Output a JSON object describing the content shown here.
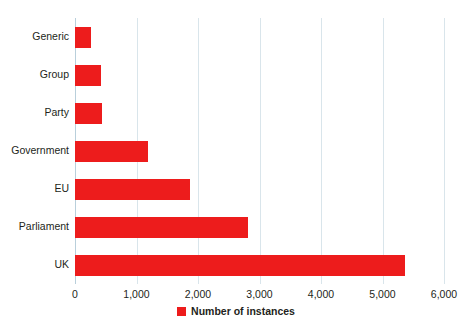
{
  "chart_data": {
    "type": "bar",
    "orientation": "horizontal",
    "title": "",
    "subtitle": "",
    "xlabel": "",
    "ylabel": "",
    "categories": [
      "Generic",
      "Group",
      "Party",
      "Government",
      "EU",
      "Parliament",
      "UK"
    ],
    "values": [
      260,
      420,
      440,
      1190,
      1870,
      2810,
      5370
    ],
    "series": [
      {
        "name": "Number of instances",
        "color": "#ed1c1c",
        "values": [
          260,
          420,
          440,
          1190,
          1870,
          2810,
          5370
        ]
      }
    ],
    "xlim": [
      0,
      6000
    ],
    "xticks": [
      0,
      1000,
      2000,
      3000,
      4000,
      5000,
      6000
    ],
    "xtick_labels": [
      "0",
      "1,000",
      "2,000",
      "3,000",
      "4,000",
      "5,000",
      "6,000"
    ],
    "grid": true,
    "grid_axis": "x",
    "grid_color": "#d9e5eb",
    "legend": {
      "position": "bottom",
      "entries": [
        {
          "label": "Number of instances",
          "color": "#ed1c1c",
          "marker": "square"
        }
      ]
    },
    "background_color": "#ffffff",
    "text_color": "#231f20"
  }
}
